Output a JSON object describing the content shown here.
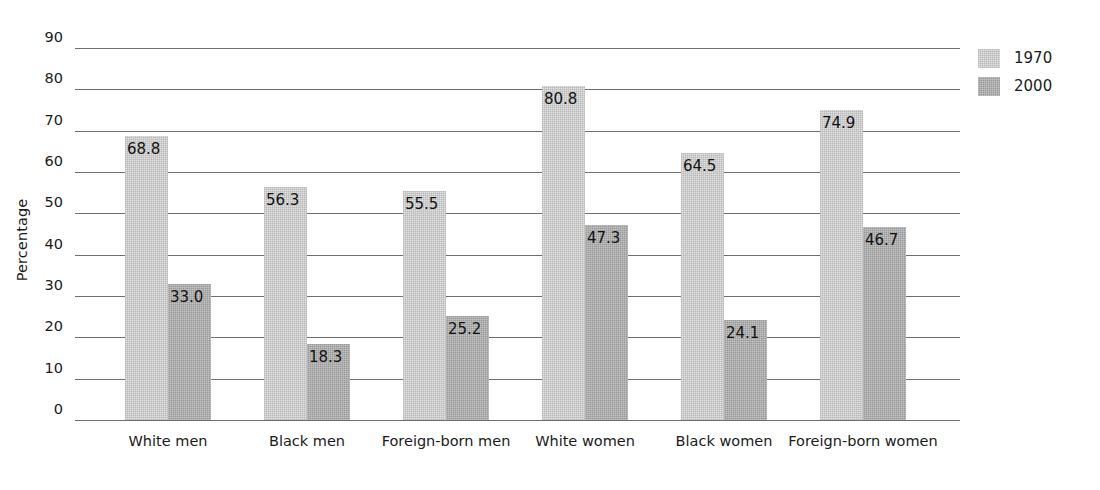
{
  "chart_data": {
    "type": "bar",
    "title": "",
    "xlabel": "",
    "ylabel": "Percentage",
    "ylim": [
      0,
      90
    ],
    "ytick_step": 10,
    "yticks": [
      "90",
      "80",
      "70",
      "60",
      "50",
      "40",
      "30",
      "20",
      "10",
      "0"
    ],
    "grid": true,
    "legend_position": "right",
    "categories": [
      "White men",
      "Black men",
      "Foreign-born men",
      "White women",
      "Black women",
      "Foreign-born women"
    ],
    "series": [
      {
        "name": "1970",
        "color": "#e2e2e2",
        "values": [
          68.8,
          56.3,
          55.5,
          80.8,
          64.5,
          74.9
        ],
        "labels": [
          "68.8",
          "56.3",
          "55.5",
          "80.8",
          "64.5",
          "74.9"
        ]
      },
      {
        "name": "2000",
        "color": "#999999",
        "values": [
          33.0,
          18.3,
          25.2,
          47.3,
          24.1,
          46.7
        ],
        "labels": [
          "33.0",
          "18.3",
          "25.2",
          "47.3",
          "24.1",
          "46.7"
        ]
      }
    ]
  },
  "legend": {
    "items": [
      {
        "label": "1970",
        "swatch": "legend-swatch-1970"
      },
      {
        "label": "2000",
        "swatch": "legend-swatch-2000"
      }
    ]
  },
  "axis": {
    "y_title": "Percentage"
  }
}
